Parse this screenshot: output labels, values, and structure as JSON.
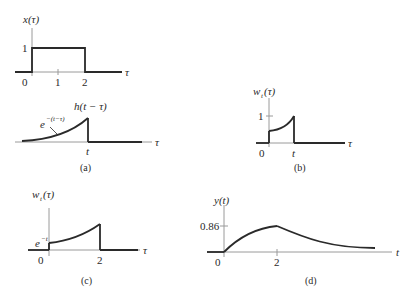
{
  "panels": {
    "a_top": {
      "ylabel": "x(τ)",
      "xlabel": "τ",
      "ytick": "1",
      "xticks": [
        "0",
        "1",
        "2"
      ]
    },
    "a_bottom": {
      "title": "h(t − τ)",
      "curve_label_base": "e",
      "curve_label_exp": "−(t−τ)",
      "xlabel": "τ",
      "xtick": "t"
    },
    "a_caption": "(a)",
    "b": {
      "ylabel_base": "w",
      "ylabel_sub": "t",
      "ylabel_arg": "(τ)",
      "xlabel": "τ",
      "ytick": "1",
      "xticks": [
        "0",
        "t"
      ],
      "caption": "(b)"
    },
    "c": {
      "ylabel_base": "w",
      "ylabel_sub": "t",
      "ylabel_arg": "(τ)",
      "xlabel": "τ",
      "ytick_base": "e",
      "ytick_exp": "−t",
      "xticks": [
        "0",
        "2"
      ],
      "caption": "(c)"
    },
    "d": {
      "ylabel": "y(t)",
      "xlabel": "t",
      "ytick": "0.86",
      "xticks": [
        "0",
        "2"
      ],
      "caption": "(d)"
    }
  },
  "colors": {
    "ink": "#2a2a2a",
    "axis": "#9a9a9a"
  }
}
